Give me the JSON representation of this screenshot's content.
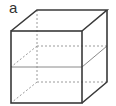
{
  "figure": {
    "label": "a",
    "colors": {
      "solid_edge": "#3a3a3a",
      "hidden_edge": "#9a9a9a",
      "section_line": "#8a8a8a"
    },
    "vertices": {
      "front_top_left": [
        11,
        31
      ],
      "front_top_right": [
        82,
        31
      ],
      "front_bottom_left": [
        11,
        103
      ],
      "front_bottom_right": [
        82,
        103
      ],
      "back_top_left": [
        37,
        10
      ],
      "back_top_right": [
        107,
        10
      ],
      "back_bottom_left": [
        37,
        82
      ],
      "back_bottom_right": [
        107,
        82
      ]
    },
    "section_plane": {
      "front_y": 67,
      "back_y": 46
    }
  }
}
